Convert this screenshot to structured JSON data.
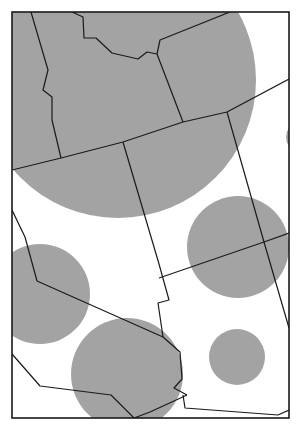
{
  "map": {
    "type": "proportional-symbol map",
    "region": "Western United States (state boundaries)",
    "frame": {
      "x": 12,
      "y": 12,
      "width": 277,
      "height": 406
    },
    "colors": {
      "circle_fill": "#a3a3a3",
      "boundary": "#1a1a1a",
      "background": "#ffffff"
    },
    "circles": [
      {
        "id": "circle-large-north",
        "cx": 118,
        "cy": 80,
        "r": 138
      },
      {
        "id": "circle-right-edge",
        "cx": 302,
        "cy": 137,
        "r": 16
      },
      {
        "id": "circle-east-mid",
        "cx": 238,
        "cy": 247,
        "r": 51
      },
      {
        "id": "circle-west-mid",
        "cx": 40,
        "cy": 294,
        "r": 50
      },
      {
        "id": "circle-south-center",
        "cx": 127,
        "cy": 374,
        "r": 56
      },
      {
        "id": "circle-southeast-small",
        "cx": 237,
        "cy": 357,
        "r": 28
      }
    ],
    "boundaries": [
      {
        "id": "boundary-west-north",
        "points": "31,12 48,70 43,90 52,97 52,120 61,158"
      },
      {
        "id": "boundary-oregon-idaho",
        "points": "12,170 61,158 123,142 183,122 227,112 289,79"
      },
      {
        "id": "boundary-idaho-montana",
        "points": "72,12 83,17 84,38 96,38 112,53 138,59 147,52 157,54"
      },
      {
        "id": "boundary-idaho-wyoming",
        "points": "157,54 160,40 230,12"
      },
      {
        "id": "boundary-wyoming-west",
        "points": "157,54 183,122"
      },
      {
        "id": "boundary-utah-west",
        "points": "123,142 159,264 169,300 158,303 163,337"
      },
      {
        "id": "boundary-colorado-west",
        "points": "227,112 264,242 289,328"
      },
      {
        "id": "boundary-four-corners-row",
        "points": "159,278 264,242 289,233"
      },
      {
        "id": "boundary-nevada-ca",
        "points": "12,210 25,237 37,281"
      },
      {
        "id": "boundary-ca-az-river",
        "points": "37,281 163,337 180,352 182,379 174,388 187,395"
      },
      {
        "id": "boundary-az-nm-south",
        "points": "183,395 185,408 278,415 289,410"
      },
      {
        "id": "boundary-baja-line",
        "points": "12,354 40,386 111,395 134,418"
      },
      {
        "id": "boundary-mexico-sonora",
        "points": "134,418 150,412 187,395"
      }
    ]
  }
}
